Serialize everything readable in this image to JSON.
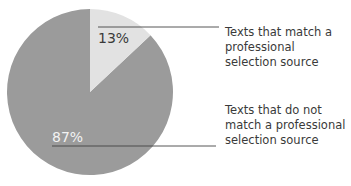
{
  "chart_data": {
    "type": "pie",
    "title": "",
    "categories": [
      "Texts that match a professional selection source",
      "Texts that do not match a professional selection source"
    ],
    "values": [
      13,
      87
    ],
    "value_labels": [
      "13%",
      "87%"
    ],
    "colors": [
      "#e2e2e2",
      "#9b9b9b"
    ],
    "start_angle_deg": 0,
    "direction": "clockwise",
    "legend_position": "right"
  },
  "labels": {
    "slice_0": "13%",
    "slice_1": "87%",
    "legend_0": "Texts that match a professional selection source",
    "legend_1": "Texts that do not match a professional selection source"
  }
}
